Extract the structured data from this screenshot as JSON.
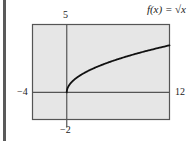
{
  "chart_data": {
    "type": "line",
    "title": "f(x) = √x",
    "function": "sqrt(x)",
    "series": [
      {
        "name": "f(x) = √x",
        "x": [
          0,
          0.25,
          0.5,
          1,
          2,
          3,
          4,
          5,
          6,
          7,
          8,
          9,
          10,
          11,
          12
        ],
        "values": [
          0,
          0.5,
          0.707,
          1,
          1.414,
          1.732,
          2,
          2.236,
          2.449,
          2.646,
          2.828,
          3,
          3.162,
          3.317,
          3.464
        ]
      }
    ],
    "xlim": [
      -4,
      12
    ],
    "ylim": [
      -2,
      5
    ],
    "xlabel": "",
    "ylabel": "",
    "tick_labels": {
      "x_min": "−4",
      "x_max": "12",
      "y_min": "−2",
      "y_max": "5"
    },
    "grid": false,
    "legend": "none"
  },
  "colors": {
    "frame_fill": "#e6e6e6",
    "frame_border": "#555555",
    "axis": "#555555",
    "curve": "#111111"
  }
}
